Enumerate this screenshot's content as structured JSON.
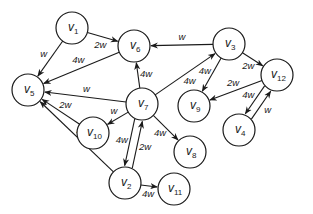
{
  "diagram": {
    "type": "weighted-directed-graph",
    "nodes": [
      {
        "id": "v1",
        "label": "v",
        "sub": "1",
        "x": 72,
        "y": 28
      },
      {
        "id": "v6",
        "label": "v",
        "sub": "6",
        "x": 134,
        "y": 46
      },
      {
        "id": "v3",
        "label": "v",
        "sub": "3",
        "x": 229,
        "y": 44
      },
      {
        "id": "v12",
        "label": "v",
        "sub": "12",
        "x": 277,
        "y": 75
      },
      {
        "id": "v5",
        "label": "v",
        "sub": "5",
        "x": 28,
        "y": 90
      },
      {
        "id": "v7",
        "label": "v",
        "sub": "7",
        "x": 142,
        "y": 104
      },
      {
        "id": "v9",
        "label": "v",
        "sub": "9",
        "x": 194,
        "y": 106
      },
      {
        "id": "v4",
        "label": "v",
        "sub": "4",
        "x": 239,
        "y": 130
      },
      {
        "id": "v10",
        "label": "v",
        "sub": "10",
        "x": 93,
        "y": 133
      },
      {
        "id": "v8",
        "label": "v",
        "sub": "8",
        "x": 190,
        "y": 152
      },
      {
        "id": "v2",
        "label": "v",
        "sub": "2",
        "x": 125,
        "y": 183
      },
      {
        "id": "v11",
        "label": "v",
        "sub": "11",
        "x": 174,
        "y": 189
      }
    ],
    "edges": [
      {
        "from": "v1",
        "to": "v6",
        "weight": "2w"
      },
      {
        "from": "v1",
        "to": "v5",
        "weight": "w"
      },
      {
        "from": "v6",
        "to": "v5",
        "weight": "4w"
      },
      {
        "from": "v3",
        "to": "v6",
        "weight": "w"
      },
      {
        "from": "v3",
        "to": "v12",
        "weight": "2w"
      },
      {
        "from": "v3",
        "to": "v9",
        "weight": "4w"
      },
      {
        "from": "v12",
        "to": "v9",
        "weight": "2w"
      },
      {
        "from": "v12",
        "to": "v4",
        "weight": "4w"
      },
      {
        "from": "v4",
        "to": "v12",
        "weight": "w"
      },
      {
        "from": "v7",
        "to": "v6",
        "weight": "4w"
      },
      {
        "from": "v7",
        "to": "v3",
        "weight": "4w"
      },
      {
        "from": "v7",
        "to": "v5",
        "weight": "w"
      },
      {
        "from": "v7",
        "to": "v10",
        "weight": "w"
      },
      {
        "from": "v7",
        "to": "v2",
        "weight": "4w"
      },
      {
        "from": "v7",
        "to": "v8",
        "weight": "4w"
      },
      {
        "from": "v2",
        "to": "v7",
        "weight": "2w"
      },
      {
        "from": "v10",
        "to": "v5",
        "weight": "2w"
      },
      {
        "from": "v2",
        "to": "v5",
        "weight": "4w"
      },
      {
        "from": "v2",
        "to": "v11",
        "weight": "4w"
      }
    ],
    "node_radius": 16,
    "stroke_color": "#1a1a1a"
  },
  "caption_clipped": "..... . ... .... ...."
}
